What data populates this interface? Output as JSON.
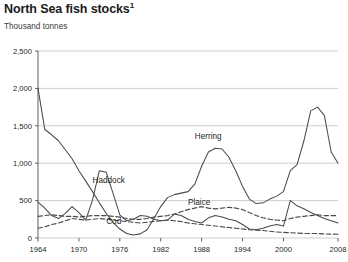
{
  "chart_data": {
    "type": "line",
    "title": "North Sea fish stocks",
    "title_superscript": "1",
    "subtitle": "Thousand tonnes",
    "ylabel": "Thousand tonnes",
    "xlabel": "",
    "ylim": [
      0,
      2500
    ],
    "xlim": [
      1964,
      2008
    ],
    "grid": true,
    "legend_position": "inline-annotations",
    "ytick_labels": [
      "0",
      "500",
      "1,000",
      "1,500",
      "2,000",
      "2,500"
    ],
    "ytick_values": [
      0,
      500,
      1000,
      1500,
      2000,
      2500
    ],
    "xtick_labels": [
      "1964",
      "1970",
      "1976",
      "1982",
      "1988",
      "1994",
      "2000",
      "2008"
    ],
    "xtick_values": [
      1964,
      1970,
      1976,
      1982,
      1988,
      1994,
      2000,
      2008
    ],
    "x": [
      1964,
      1965,
      1966,
      1967,
      1968,
      1969,
      1970,
      1971,
      1972,
      1973,
      1974,
      1975,
      1976,
      1977,
      1978,
      1979,
      1980,
      1981,
      1982,
      1983,
      1984,
      1985,
      1986,
      1987,
      1988,
      1989,
      1990,
      1991,
      1992,
      1993,
      1994,
      1995,
      1996,
      1997,
      1998,
      1999,
      2000,
      2001,
      2002,
      2003,
      2004,
      2005,
      2006,
      2007,
      2008
    ],
    "series": [
      {
        "name": "Herring",
        "style": "solid",
        "label_x": 1987,
        "label_y": 1320,
        "values": [
          2000,
          1450,
          1380,
          1300,
          1180,
          1060,
          900,
          760,
          620,
          470,
          330,
          210,
          120,
          60,
          40,
          55,
          110,
          260,
          420,
          540,
          580,
          600,
          620,
          720,
          960,
          1150,
          1200,
          1190,
          1080,
          900,
          690,
          520,
          460,
          470,
          520,
          560,
          620,
          900,
          980,
          1300,
          1700,
          1750,
          1640,
          1150,
          1000
        ]
      },
      {
        "name": "Haddock",
        "style": "solid",
        "label_x": 1972,
        "label_y": 740,
        "values": [
          480,
          400,
          300,
          260,
          330,
          420,
          340,
          240,
          510,
          900,
          880,
          600,
          310,
          230,
          250,
          300,
          290,
          250,
          230,
          240,
          320,
          300,
          250,
          220,
          200,
          270,
          300,
          280,
          250,
          230,
          180,
          120,
          110,
          130,
          160,
          180,
          160,
          500,
          430,
          390,
          340,
          300,
          260,
          230,
          200
        ]
      },
      {
        "name": "Plaice",
        "style": "dashed",
        "label_x": 1986,
        "label_y": 440,
        "values": [
          290,
          300,
          310,
          300,
          290,
          290,
          280,
          290,
          300,
          300,
          300,
          290,
          280,
          260,
          250,
          250,
          260,
          280,
          290,
          300,
          320,
          350,
          380,
          400,
          420,
          400,
          390,
          400,
          410,
          400,
          380,
          340,
          300,
          270,
          250,
          240,
          230,
          260,
          280,
          290,
          300,
          310,
          300,
          300,
          300
        ]
      },
      {
        "name": "Cod",
        "style": "dashed",
        "label_x": 1974,
        "label_y": 190,
        "values": [
          130,
          150,
          180,
          200,
          230,
          260,
          250,
          240,
          250,
          260,
          250,
          240,
          230,
          220,
          210,
          200,
          210,
          220,
          230,
          240,
          230,
          220,
          200,
          190,
          180,
          170,
          160,
          150,
          140,
          130,
          120,
          110,
          105,
          100,
          90,
          80,
          75,
          70,
          65,
          60,
          60,
          60,
          55,
          52,
          50
        ]
      }
    ]
  }
}
